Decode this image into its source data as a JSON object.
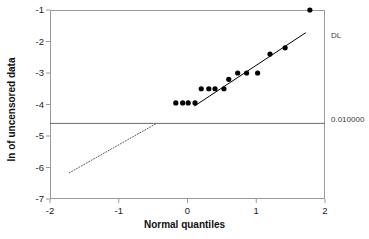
{
  "chart_data": {
    "type": "scatter",
    "title": "",
    "subtitle": "",
    "xlabel": "Normal quantiles",
    "ylabel": "ln of uncensored data",
    "xlim": [
      -2,
      2
    ],
    "ylim": [
      -7,
      -1
    ],
    "grid": false,
    "legend_position": "none",
    "xticks": [
      "-2",
      "-1",
      "0",
      "1",
      "2"
    ],
    "xtick_values": [
      -2,
      -1,
      0,
      1,
      2
    ],
    "yticks": [
      "-1",
      "-2",
      "-3",
      "-4",
      "-5",
      "-6",
      "-7"
    ],
    "ytick_values": [
      -1,
      -2,
      -3,
      -4,
      -5,
      -6,
      -7
    ],
    "series": [
      {
        "name": "uncensored observations",
        "type": "scatter",
        "marker": "filled-circle",
        "color": "#000000",
        "points": [
          {
            "x": -0.17,
            "y": -3.95
          },
          {
            "x": -0.07,
            "y": -3.95
          },
          {
            "x": 0.01,
            "y": -3.95
          },
          {
            "x": 0.11,
            "y": -3.95
          },
          {
            "x": 0.2,
            "y": -3.5
          },
          {
            "x": 0.31,
            "y": -3.5
          },
          {
            "x": 0.4,
            "y": -3.5
          },
          {
            "x": 0.53,
            "y": -3.5
          },
          {
            "x": 0.6,
            "y": -3.2
          },
          {
            "x": 0.73,
            "y": -3.0
          },
          {
            "x": 0.86,
            "y": -3.0
          },
          {
            "x": 1.02,
            "y": -3.0
          },
          {
            "x": 1.2,
            "y": -2.4
          },
          {
            "x": 1.42,
            "y": -2.2
          },
          {
            "x": 1.78,
            "y": -1.0
          }
        ]
      },
      {
        "name": "fitted line (observed range)",
        "type": "line",
        "style": "solid",
        "color": "#000000",
        "points": [
          {
            "x": 0.1,
            "y": -4.05
          },
          {
            "x": 1.72,
            "y": -1.72
          }
        ]
      },
      {
        "name": "fitted line (extrapolated below detection limit)",
        "type": "line",
        "style": "dotted",
        "color": "#555555",
        "points": [
          {
            "x": -1.72,
            "y": -6.17
          },
          {
            "x": -0.45,
            "y": -4.6
          }
        ]
      }
    ],
    "reference_lines": [
      {
        "name": "detection-limit",
        "orientation": "horizontal",
        "y": -4.6,
        "color": "#6b6b6b",
        "right_label": "0.010000",
        "top_right_label": "DL"
      }
    ],
    "annotations": [
      {
        "name": "dl-label",
        "text": "DL",
        "x": 2.08,
        "y": -1.72
      },
      {
        "name": "threshold-value-label",
        "text": "0.010000",
        "x": 2.08,
        "y": -4.6
      }
    ]
  }
}
